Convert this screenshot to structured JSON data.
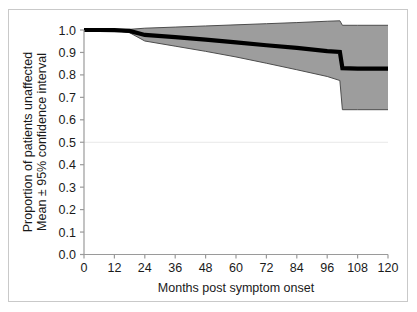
{
  "chart_data": {
    "type": "line",
    "title": "",
    "subtitle": "",
    "xlabel": "Months post symptom onset",
    "ylabel": "Proportion of patients unaffected\nMean ± 95% confidence interval",
    "ylabel_line1": "Proportion of patients unaffected",
    "ylabel_line2": "Mean ± 95% confidence interval",
    "xlim": [
      0,
      120
    ],
    "ylim": [
      0.0,
      1.0
    ],
    "xticks": [
      0,
      12,
      24,
      36,
      48,
      60,
      72,
      84,
      96,
      108,
      120
    ],
    "xtick_labels": [
      "0",
      "12",
      "24",
      "36",
      "48",
      "60",
      "72",
      "84",
      "96",
      "108",
      "120"
    ],
    "yticks": [
      0.0,
      0.1,
      0.2,
      0.3,
      0.4,
      0.5,
      0.6,
      0.7,
      0.8,
      0.9,
      1.0
    ],
    "ytick_labels": [
      "0.0",
      "0.1",
      "0.2",
      "0.3",
      "0.4",
      "0.5",
      "0.6",
      "0.7",
      "0.8",
      "0.9",
      "1.0"
    ],
    "grid": "horizontal-faint-at-0.5",
    "gridlines": [
      0.5
    ],
    "legend": null,
    "legend_position": "none",
    "band_color": "#9d9d9d",
    "band_edge_color": "#4d4d4d",
    "line_color": "#000000",
    "frame_color": "#c9c9c9",
    "axis_color": "#808080",
    "x": [
      0,
      6,
      12,
      18,
      24,
      36,
      48,
      60,
      72,
      84,
      96,
      101,
      102,
      108,
      120
    ],
    "series": [
      {
        "name": "Mean",
        "role": "mean",
        "values": [
          1.0,
          1.0,
          0.999,
          0.996,
          0.978,
          0.968,
          0.957,
          0.945,
          0.932,
          0.92,
          0.906,
          0.902,
          0.83,
          0.828,
          0.828
        ]
      },
      {
        "name": "Upper 95% CI",
        "role": "ci-upper",
        "values": [
          1.0,
          1.0,
          1.0,
          1.003,
          1.008,
          1.013,
          1.018,
          1.023,
          1.028,
          1.033,
          1.039,
          1.041,
          1.021,
          1.021,
          1.021
        ]
      },
      {
        "name": "Lower 95% CI",
        "role": "ci-lower",
        "values": [
          1.0,
          1.0,
          0.998,
          0.988,
          0.951,
          0.928,
          0.905,
          0.88,
          0.852,
          0.823,
          0.793,
          0.775,
          0.645,
          0.645,
          0.645
        ]
      }
    ],
    "annotations": []
  }
}
